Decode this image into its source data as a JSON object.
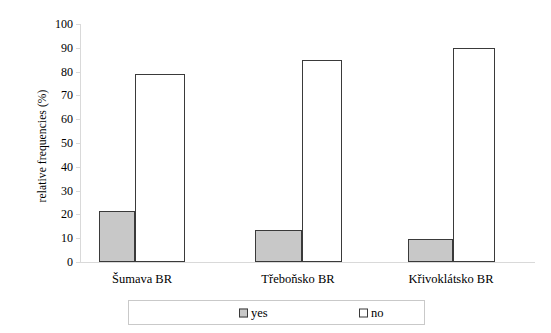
{
  "chart_data": {
    "type": "bar",
    "title": "",
    "xlabel": "",
    "ylabel": "relative frequencies (%)",
    "categories": [
      "Šumava BR",
      "Třeboňsko BR",
      "Křivoklátsko BR"
    ],
    "series": [
      {
        "name": "yes",
        "values": [
          21.5,
          13.5,
          9.5
        ],
        "color": "#c8c8c8"
      },
      {
        "name": "no",
        "values": [
          79.0,
          85.0,
          90.0
        ],
        "color": "#ffffff"
      }
    ],
    "ylim": [
      0,
      100
    ],
    "yticks": [
      0,
      10,
      20,
      30,
      40,
      50,
      60,
      70,
      80,
      90,
      100
    ],
    "ytick_labels": [
      "0",
      "10",
      "20",
      "30",
      "40",
      "50",
      "60",
      "70",
      "80",
      "90",
      "100"
    ],
    "grid": false,
    "legend_position": "bottom",
    "legend_entries": [
      "yes",
      "no"
    ]
  },
  "legend": {
    "items": [
      {
        "label": "yes",
        "swatch": "legend-swatch-yes"
      },
      {
        "label": "no",
        "swatch": "legend-swatch-no"
      }
    ]
  },
  "axis": {
    "y_title": "relative frequencies (%)"
  }
}
